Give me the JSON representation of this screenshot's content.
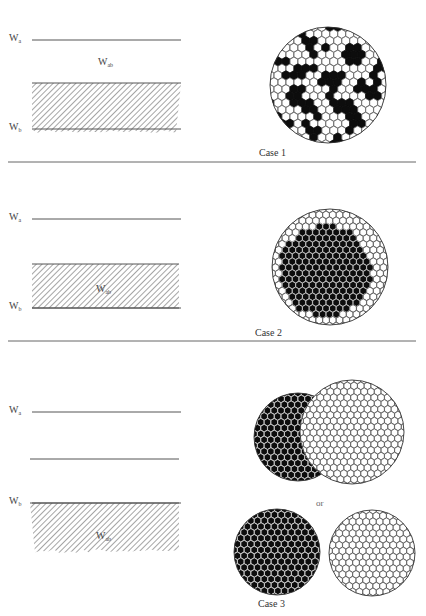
{
  "figure": {
    "colors": {
      "ink": "#111111",
      "line": "#555555",
      "hatch": "#5a5a5a",
      "background": "#ffffff"
    },
    "cases": [
      {
        "label": "Case 1",
        "label_pos": [
          259,
          157
        ],
        "separator_y": 162,
        "levels": [
          {
            "name": "W",
            "sub": "a",
            "y": 40
          },
          {
            "name": "W",
            "sub": "b",
            "y": 129
          }
        ],
        "interaction_label": {
          "name": "W",
          "sub": "ab",
          "pos": [
            98,
            62
          ]
        },
        "hatch": {
          "x": 32,
          "y": 13,
          "w": 149,
          "h": 70,
          "ragged_top": true
        },
        "extra_lines": [],
        "circles": [
          {
            "cx": 328,
            "cy": 85,
            "r": 58,
            "style": "mixed"
          }
        ]
      },
      {
        "label": "Case 2",
        "label_pos": [
          255,
          337
        ],
        "separator_y": 341,
        "levels": [
          {
            "name": "W",
            "sub": "a",
            "y": 219
          },
          {
            "name": "W",
            "sub": "b",
            "y": 308
          }
        ],
        "interaction_label": {
          "name": "W",
          "sub": "ab",
          "pos": [
            96,
            289
          ]
        },
        "hatch": {
          "x": 32,
          "y": 264,
          "w": 147,
          "h": 44,
          "ragged_top": false
        },
        "extra_lines": [],
        "circles": [
          {
            "cx": 330,
            "cy": 267,
            "r": 58,
            "style": "core-shell",
            "core_cx": 325,
            "core_cy": 271,
            "core_r": 46
          }
        ]
      },
      {
        "label": "Case 3",
        "label_pos": [
          258,
          608
        ],
        "separator_y": null,
        "levels": [
          {
            "name": "W",
            "sub": "a",
            "y": 412
          },
          {
            "name": "W",
            "sub": "b",
            "y": 503
          }
        ],
        "interaction_label": {
          "name": "W",
          "sub": "ab",
          "pos": [
            96,
            536
          ]
        },
        "hatch": {
          "x": 30,
          "y": 503,
          "w": 149,
          "h": 50,
          "ragged_bottom": true
        },
        "extra_lines": [
          {
            "x1": 30,
            "x2": 179,
            "y": 459
          }
        ],
        "circles": [
          {
            "cx": 298,
            "cy": 437,
            "r": 44,
            "style": "dark"
          },
          {
            "cx": 352,
            "cy": 432,
            "r": 52,
            "style": "light"
          },
          {
            "cx": 277,
            "cy": 552,
            "r": 43,
            "style": "dark"
          },
          {
            "cx": 372,
            "cy": 553,
            "r": 43,
            "style": "light"
          }
        ],
        "or_label": {
          "text": "or",
          "pos": [
            316,
            506
          ]
        }
      }
    ]
  }
}
